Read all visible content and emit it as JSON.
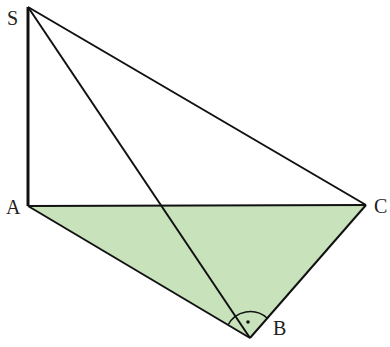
{
  "diagram": {
    "fill_color": "#c8e3bc",
    "stroke_color": "#111111",
    "points": {
      "S": {
        "label": "S",
        "x": 28,
        "y": 7
      },
      "A": {
        "label": "A",
        "x": 28,
        "y": 206
      },
      "B": {
        "label": "B",
        "x": 250,
        "y": 338
      },
      "C": {
        "label": "C",
        "x": 366,
        "y": 205
      }
    },
    "edges": [
      "SA",
      "SB",
      "SC",
      "AB",
      "AC",
      "BC"
    ],
    "shaded_face": "ABC",
    "right_angle_marker": "B"
  }
}
